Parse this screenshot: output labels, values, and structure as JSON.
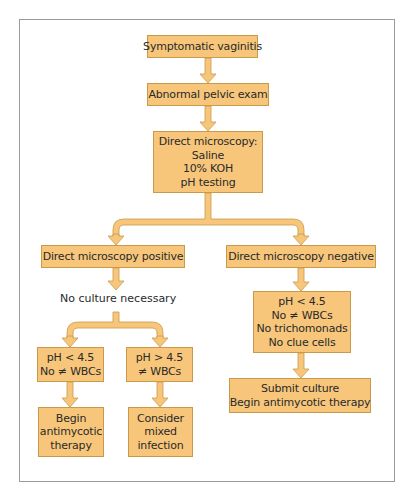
{
  "colors": {
    "box_fill": "#f7c67a",
    "box_border": "#c99a4a",
    "arrow_fill": "#f7c67a",
    "arrow_stroke": "#c99a4a",
    "frame_border": "#9a9a9a"
  },
  "nodes": {
    "symptomatic": {
      "lines": [
        "Symptomatic vaginitis"
      ]
    },
    "pelvic_exam": {
      "lines": [
        "Abnormal pelvic exam"
      ]
    },
    "microscopy": {
      "lines": [
        "Direct microscopy:",
        "Saline",
        "10% KOH",
        "pH testing"
      ]
    },
    "positive": {
      "lines": [
        "Direct microscopy positive"
      ]
    },
    "negative": {
      "lines": [
        "Direct microscopy negative"
      ]
    },
    "no_culture": {
      "text": "No culture necessary"
    },
    "ph_low_left": {
      "lines": [
        "pH < 4.5",
        "No ≠ WBCs"
      ]
    },
    "ph_high": {
      "lines": [
        "pH > 4.5",
        "≠ WBCs"
      ]
    },
    "begin_therapy": {
      "lines": [
        "Begin",
        "antimycotic",
        "therapy"
      ]
    },
    "mixed_infection": {
      "lines": [
        "Consider",
        "mixed",
        "infection"
      ]
    },
    "negative_criteria": {
      "lines": [
        "pH < 4.5",
        "No ≠ WBCs",
        "No trichomonads",
        "No clue cells"
      ]
    },
    "submit_culture": {
      "lines": [
        "Submit culture",
        "Begin antimycotic therapy"
      ]
    }
  },
  "edges": [
    {
      "from": "symptomatic",
      "to": "pelvic_exam"
    },
    {
      "from": "pelvic_exam",
      "to": "microscopy"
    },
    {
      "from": "microscopy",
      "to": "positive"
    },
    {
      "from": "microscopy",
      "to": "negative"
    },
    {
      "from": "positive",
      "to": "no_culture"
    },
    {
      "from": "no_culture",
      "to": "ph_low_left"
    },
    {
      "from": "no_culture",
      "to": "ph_high"
    },
    {
      "from": "ph_low_left",
      "to": "begin_therapy"
    },
    {
      "from": "ph_high",
      "to": "mixed_infection"
    },
    {
      "from": "negative",
      "to": "negative_criteria"
    },
    {
      "from": "negative_criteria",
      "to": "submit_culture"
    }
  ]
}
